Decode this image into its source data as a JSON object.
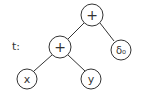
{
  "diagram": {
    "tree_label": "t:",
    "nodes": {
      "root": "+",
      "inner": "+",
      "leaf_x": "x",
      "leaf_y": "y",
      "leaf_right": "δ₀"
    },
    "edges": [
      [
        "root",
        "inner"
      ],
      [
        "root",
        "leaf_right"
      ],
      [
        "inner",
        "leaf_x"
      ],
      [
        "inner",
        "leaf_y"
      ]
    ],
    "stroke_color": "#333333"
  }
}
